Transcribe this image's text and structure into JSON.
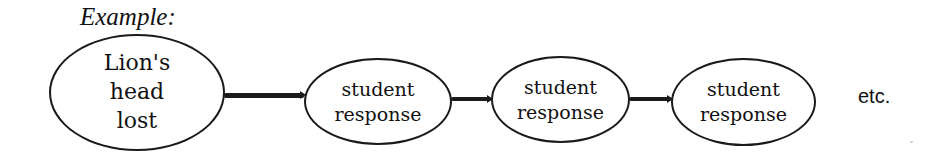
{
  "diagram": {
    "caption": "Example:",
    "start_node": {
      "lines": [
        "Lion's",
        "head",
        "lost"
      ]
    },
    "response_nodes": [
      {
        "lines": [
          "student",
          "response"
        ]
      },
      {
        "lines": [
          "student",
          "response"
        ]
      },
      {
        "lines": [
          "student",
          "response"
        ]
      }
    ],
    "continuation": "etc.",
    "connectors": [
      {
        "from": "start_node",
        "to": "response_nodes.0"
      },
      {
        "from": "response_nodes.0",
        "to": "response_nodes.1"
      },
      {
        "from": "response_nodes.1",
        "to": "response_nodes.2"
      }
    ],
    "colors": {
      "stroke": "#1a1a1a",
      "text": "#111111",
      "background": "#ffffff"
    }
  }
}
